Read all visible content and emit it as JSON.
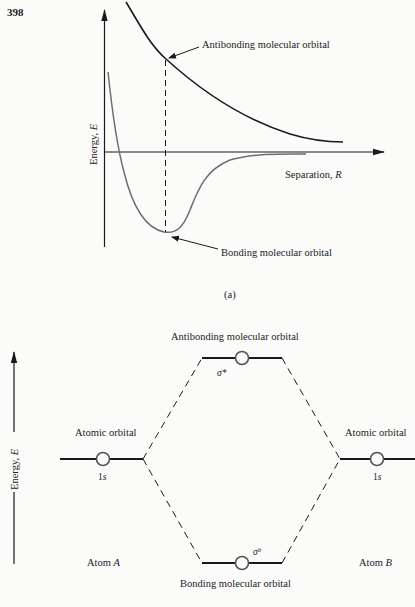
{
  "page": {
    "number": "398"
  },
  "figure_a": {
    "caption": "(a)",
    "y_axis_label": "Energy, ",
    "y_axis_var": "E",
    "x_axis_label": "Separation, ",
    "x_axis_var": "R",
    "antibonding_label": "Antibonding molecular orbital",
    "bonding_label": "Bonding molecular orbital",
    "colors": {
      "antibonding_curve": "#1a1a1a",
      "bonding_curve": "#6e6e6e",
      "axes": "#1a1a1a"
    }
  },
  "figure_b": {
    "y_axis_label": "Energy, ",
    "y_axis_var": "E",
    "antibonding_label": "Antibonding molecular orbital",
    "bonding_label": "Bonding molecular orbital",
    "antibonding_symbol": "σ*",
    "bonding_symbol": "σ",
    "bonding_symbol_sup": "b",
    "left_atomic_orbital_label": "Atomic orbital",
    "right_atomic_orbital_label": "Atomic orbital",
    "left_orbital_name": "1",
    "left_orbital_sub": "s",
    "right_orbital_name": "1",
    "right_orbital_sub": "s",
    "atom_a_label": "Atom ",
    "atom_a_var": "A",
    "atom_b_label": "Atom ",
    "atom_b_var": "B"
  }
}
